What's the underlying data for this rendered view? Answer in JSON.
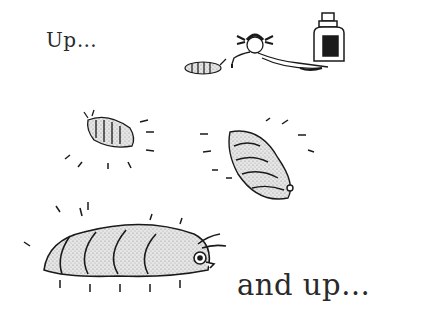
{
  "page": {
    "captions": {
      "top": "Up…",
      "bottom": "and up…"
    },
    "illustrations": [
      {
        "name": "small-bug-with-girl-and-bottle",
        "description": "girl lying on floor dripping potion onto a small bug, bottle beside her"
      },
      {
        "name": "medium-bug-left",
        "description": "bug slightly bigger, with motion lines"
      },
      {
        "name": "larger-bug-right",
        "description": "bug bigger again, with motion lines"
      },
      {
        "name": "giant-bug-bottom",
        "description": "very large bug with antennae and motion lines"
      }
    ],
    "colors": {
      "ink": "#1a1a1a",
      "paper": "#ffffff",
      "stipple": "#cfcfcf"
    }
  }
}
